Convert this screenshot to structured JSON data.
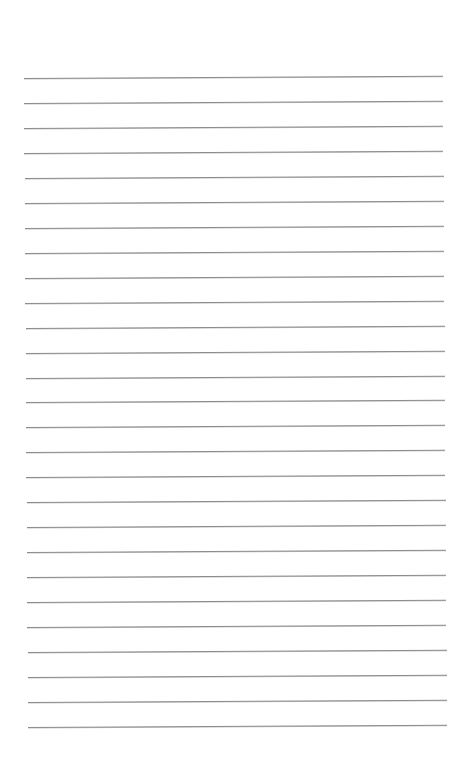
{
  "page": {
    "type": "lined-paper",
    "background_color": "#ffffff",
    "line_color": "#8c8c8c",
    "line_count": 27,
    "first_line_y": 77,
    "line_spacing": 24.96,
    "line_left_x_top": 24,
    "line_left_x_bottom": 28,
    "line_right_x_top": 443,
    "line_right_x_bottom": 447,
    "tilt_deg": -0.3
  }
}
